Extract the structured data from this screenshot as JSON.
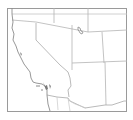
{
  "map": {
    "title": "Southwestern United States",
    "region_labels": [
      "California",
      "Nevada",
      "Utah",
      "Arizona",
      "Oregon",
      "Idaho",
      "Colorado",
      "New Mexico",
      "Mexico"
    ],
    "colors": {
      "background": "#ffffff",
      "frame": "#9a9a9a",
      "border": "#b4b4b4",
      "coast": "#8c8c8c",
      "water": "#7a7a7a"
    },
    "features": {
      "lake": "Great Salt Lake",
      "islands": "Channel Islands"
    }
  }
}
